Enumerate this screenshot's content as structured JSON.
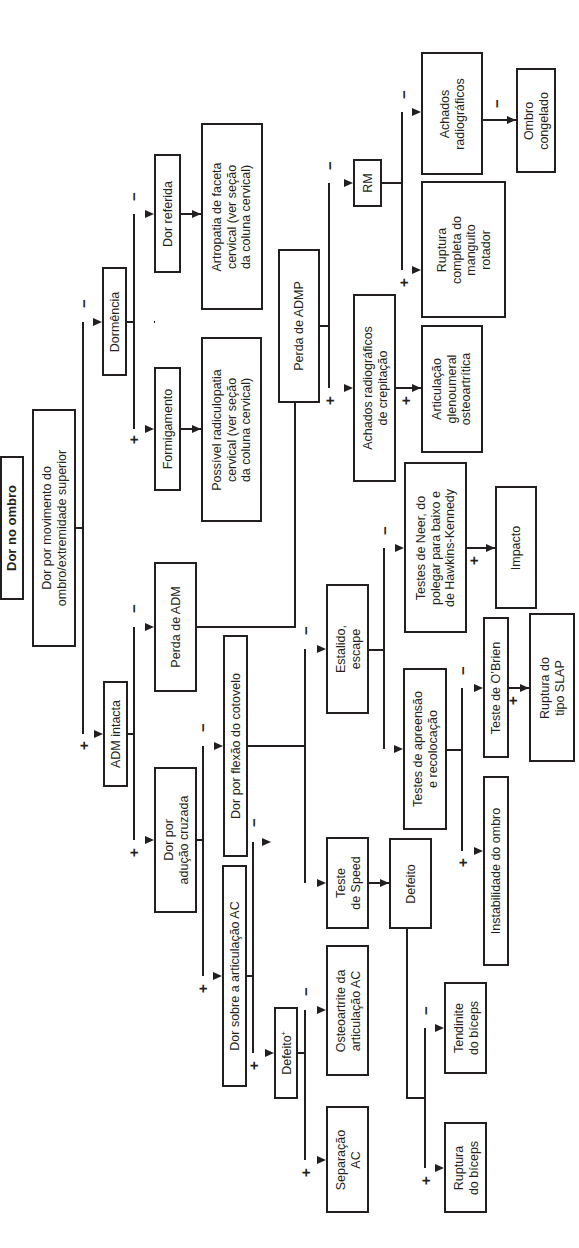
{
  "diagram": {
    "title": "Dor no ombro",
    "orientation": "rotated -90deg (read bottom-to-top)",
    "nodes": [
      {
        "id": "title",
        "label": "Dor no ombro",
        "x": 0,
        "y": 456,
        "w": 24,
        "h": 144,
        "bold": true
      },
      {
        "id": "dor_movimento",
        "label": "Dor por movimento do\nombro/extremidade superior",
        "x": 32,
        "y": 409,
        "w": 44,
        "h": 238
      },
      {
        "id": "dormencia",
        "label": "Dormência",
        "x": 102,
        "y": 267,
        "w": 25,
        "h": 109
      },
      {
        "id": "adm_intacta",
        "label": "ADM intacta",
        "x": 103,
        "y": 681,
        "w": 25,
        "h": 106
      },
      {
        "id": "dor_referida",
        "label": "Dor referida",
        "x": 154,
        "y": 154,
        "w": 27,
        "h": 119
      },
      {
        "id": "formigamento",
        "label": "Formigamento",
        "x": 154,
        "y": 367,
        "w": 27,
        "h": 124
      },
      {
        "id": "perda_adm",
        "label": "Perda de ADM",
        "x": 154,
        "y": 562,
        "w": 43,
        "h": 130
      },
      {
        "id": "aducao_cruzada",
        "label": "Dor por\nadução cruzada",
        "x": 154,
        "y": 767,
        "w": 43,
        "h": 146
      },
      {
        "id": "artropatia",
        "label": "Artropatia de faceta\ncervical (ver seção\nda coluna cervical)",
        "x": 201,
        "y": 123,
        "w": 62,
        "h": 187
      },
      {
        "id": "radiculopatia",
        "label": "Possível radiculopatia\ncervical (ver seção\nda coluna cervical)",
        "x": 201,
        "y": 337,
        "w": 61,
        "h": 185
      },
      {
        "id": "flexao_cotovelo",
        "label": "Dor por flexão do cotovelo",
        "x": 223,
        "y": 635,
        "w": 25,
        "h": 222
      },
      {
        "id": "dor_sobre_ac",
        "label": "Dor sobre a articulação AC",
        "x": 222,
        "y": 865,
        "w": 25,
        "h": 222
      },
      {
        "id": "defeito_ac",
        "label": "Defeito",
        "sup": "+",
        "x": 274,
        "y": 1007,
        "w": 24,
        "h": 92
      },
      {
        "id": "perda_admp",
        "label": "Perda de ADMP",
        "x": 278,
        "y": 249,
        "w": 42,
        "h": 154
      },
      {
        "id": "estalido",
        "label": "Estalido,\nescape",
        "x": 326,
        "y": 584,
        "w": 43,
        "h": 130
      },
      {
        "id": "teste_speed",
        "label": "Teste\nde Speed",
        "x": 326,
        "y": 837,
        "w": 43,
        "h": 92
      },
      {
        "id": "osteoartrite_ac",
        "label": "Osteoartrite da\narticulação AC",
        "x": 326,
        "y": 945,
        "w": 43,
        "h": 131
      },
      {
        "id": "separacao_ac",
        "label": "Separação\nAC",
        "x": 326,
        "y": 1106,
        "w": 43,
        "h": 107
      },
      {
        "id": "rm",
        "label": "RM",
        "x": 353,
        "y": 159,
        "w": 29,
        "h": 48
      },
      {
        "id": "achados_crepitacao",
        "label": "Achados radiográficos\nde crepitação",
        "x": 353,
        "y": 294,
        "w": 43,
        "h": 188
      },
      {
        "id": "defeito_speed",
        "label": "Defeito",
        "x": 389,
        "y": 838,
        "w": 43,
        "h": 91
      },
      {
        "id": "testes_neer",
        "label": "Testes de Neer, do\npolegar para baixo e\nde Hawkins-Kennedy",
        "x": 404,
        "y": 462,
        "w": 63,
        "h": 171
      },
      {
        "id": "testes_apreensao",
        "label": "Testes de apreensão\ne recolocação",
        "x": 403,
        "y": 668,
        "w": 44,
        "h": 162
      },
      {
        "id": "achados_radiograficos",
        "label": "Achados\nradiográficos",
        "x": 421,
        "y": 52,
        "w": 62,
        "h": 123
      },
      {
        "id": "ruptura_manguito",
        "label": "Ruptura\ncompleta do\nmanguito\nrotador",
        "x": 421,
        "y": 181,
        "w": 85,
        "h": 137
      },
      {
        "id": "glenoumeral",
        "label": "Articulação\nglenoumeral\nosteoartrítica",
        "x": 421,
        "y": 325,
        "w": 62,
        "h": 128
      },
      {
        "id": "tendinite_biceps",
        "label": "Tendinite\ndo bíceps",
        "x": 444,
        "y": 982,
        "w": 43,
        "h": 92
      },
      {
        "id": "ruptura_biceps",
        "label": "Ruptura\ndo bíceps",
        "x": 444,
        "y": 1122,
        "w": 43,
        "h": 91
      },
      {
        "id": "teste_obrien",
        "label": "Teste de O’Brien",
        "x": 483,
        "y": 617,
        "w": 26,
        "h": 141
      },
      {
        "id": "instabilidade",
        "label": "Instabilidade do ombro",
        "x": 483,
        "y": 776,
        "w": 26,
        "h": 190
      },
      {
        "id": "impacto",
        "label": "Impacto",
        "x": 495,
        "y": 486,
        "w": 42,
        "h": 123
      },
      {
        "id": "ruptura_slap",
        "label": "Ruptura do\ntipo SLAP",
        "x": 529,
        "y": 613,
        "w": 46,
        "h": 149
      },
      {
        "id": "ombro_congelado",
        "label": "Ombro\ncongelado",
        "x": 516,
        "y": 68,
        "w": 40,
        "h": 105
      }
    ],
    "lines": [
      [
        [
          76,
          528
        ],
        [
          83,
          528
        ]
      ],
      [
        [
          83,
          322
        ],
        [
          83,
          734
        ]
      ],
      [
        [
          154,
          322
        ],
        [
          155,
          322
        ]
      ],
      [
        [
          127,
          322
        ],
        [
          134,
          322
        ]
      ],
      [
        [
          134,
          214
        ],
        [
          134,
          429
        ]
      ],
      [
        [
          181,
          214
        ],
        [
          201,
          214
        ]
      ],
      [
        [
          181,
          429
        ],
        [
          201,
          429
        ]
      ],
      [
        [
          128,
          734
        ],
        [
          134,
          734
        ]
      ],
      [
        [
          134,
          627
        ],
        [
          134,
          840
        ]
      ],
      [
        [
          197,
          627
        ],
        [
          295,
          627
        ],
        [
          295,
          403
        ]
      ],
      [
        [
          197,
          840
        ],
        [
          203,
          840
        ]
      ],
      [
        [
          203,
          746
        ],
        [
          203,
          976
        ]
      ],
      [
        [
          248,
          746
        ],
        [
          305,
          746
        ]
      ],
      [
        [
          305,
          649
        ],
        [
          305,
          883
        ]
      ],
      [
        [
          247,
          976
        ],
        [
          253,
          976
        ]
      ],
      [
        [
          253,
          842
        ],
        [
          253,
          1053
        ]
      ],
      [
        [
          298,
          1053
        ],
        [
          305,
          1053
        ]
      ],
      [
        [
          305,
          1010
        ],
        [
          305,
          1160
        ]
      ],
      [
        [
          320,
          326
        ],
        [
          329,
          326
        ]
      ],
      [
        [
          329,
          183
        ],
        [
          329,
          388
        ]
      ],
      [
        [
          382,
          183
        ],
        [
          402,
          183
        ]
      ],
      [
        [
          402,
          112
        ],
        [
          402,
          270
        ]
      ],
      [
        [
          396,
          388
        ],
        [
          421,
          388
        ]
      ],
      [
        [
          483,
          120
        ],
        [
          516,
          120
        ]
      ],
      [
        [
          369,
          650
        ],
        [
          384,
          650
        ]
      ],
      [
        [
          384,
          548
        ],
        [
          384,
          749
        ]
      ],
      [
        [
          467,
          548
        ],
        [
          495,
          548
        ]
      ],
      [
        [
          447,
          750
        ],
        [
          462,
          750
        ]
      ],
      [
        [
          462,
          688
        ],
        [
          462,
          851
        ]
      ],
      [
        [
          509,
          688
        ],
        [
          529,
          688
        ]
      ],
      [
        [
          369,
          883
        ],
        [
          389,
          883
        ]
      ],
      [
        [
          407,
          929
        ],
        [
          407,
          1098
        ],
        [
          425,
          1098
        ]
      ],
      [
        [
          425,
          1028
        ],
        [
          425,
          1168
        ]
      ]
    ],
    "arrows": [
      {
        "x": 102,
        "y": 322
      },
      {
        "x": 103,
        "y": 734
      },
      {
        "x": 154,
        "y": 214
      },
      {
        "x": 154,
        "y": 429
      },
      {
        "x": 201,
        "y": 214
      },
      {
        "x": 201,
        "y": 429
      },
      {
        "x": 154,
        "y": 627
      },
      {
        "x": 154,
        "y": 840
      },
      {
        "x": 223,
        "y": 746
      },
      {
        "x": 222,
        "y": 976
      },
      {
        "x": 271,
        "y": 842
      },
      {
        "x": 274,
        "y": 1053
      },
      {
        "x": 326,
        "y": 649
      },
      {
        "x": 326,
        "y": 883
      },
      {
        "x": 326,
        "y": 1010
      },
      {
        "x": 326,
        "y": 1160
      },
      {
        "x": 353,
        "y": 183
      },
      {
        "x": 353,
        "y": 388
      },
      {
        "x": 421,
        "y": 112
      },
      {
        "x": 421,
        "y": 270
      },
      {
        "x": 421,
        "y": 388
      },
      {
        "x": 516,
        "y": 120
      },
      {
        "x": 404,
        "y": 548
      },
      {
        "x": 403,
        "y": 749
      },
      {
        "x": 495,
        "y": 548
      },
      {
        "x": 483,
        "y": 688
      },
      {
        "x": 483,
        "y": 851
      },
      {
        "x": 529,
        "y": 688
      },
      {
        "x": 389,
        "y": 883
      },
      {
        "x": 444,
        "y": 1028
      },
      {
        "x": 444,
        "y": 1168
      }
    ],
    "signs": [
      {
        "t": "−",
        "x": 84,
        "y": 303
      },
      {
        "t": "+",
        "x": 84,
        "y": 745
      },
      {
        "t": "−",
        "x": 134,
        "y": 196
      },
      {
        "t": "+",
        "x": 134,
        "y": 439
      },
      {
        "t": "−",
        "x": 134,
        "y": 608
      },
      {
        "t": "+",
        "x": 134,
        "y": 852
      },
      {
        "t": "−",
        "x": 203,
        "y": 727
      },
      {
        "t": "+",
        "x": 203,
        "y": 988
      },
      {
        "t": "−",
        "x": 254,
        "y": 822
      },
      {
        "t": "+",
        "x": 254,
        "y": 1065
      },
      {
        "t": "−",
        "x": 306,
        "y": 630
      },
      {
        "t": "−",
        "x": 306,
        "y": 991
      },
      {
        "t": "+",
        "x": 306,
        "y": 1172
      },
      {
        "t": "−",
        "x": 330,
        "y": 165
      },
      {
        "t": "+",
        "x": 330,
        "y": 400
      },
      {
        "t": "−",
        "x": 404,
        "y": 94
      },
      {
        "t": "+",
        "x": 404,
        "y": 282
      },
      {
        "t": "+",
        "x": 406,
        "y": 400
      },
      {
        "t": "−",
        "x": 497,
        "y": 103
      },
      {
        "t": "−",
        "x": 385,
        "y": 530
      },
      {
        "t": "+",
        "x": 474,
        "y": 560
      },
      {
        "t": "−",
        "x": 463,
        "y": 670
      },
      {
        "t": "+",
        "x": 463,
        "y": 862
      },
      {
        "t": "+",
        "x": 513,
        "y": 700
      },
      {
        "t": "−",
        "x": 426,
        "y": 1010
      },
      {
        "t": "+",
        "x": 426,
        "y": 1180
      }
    ],
    "colors": {
      "stroke": "#231f20",
      "background": "#ffffff"
    }
  }
}
